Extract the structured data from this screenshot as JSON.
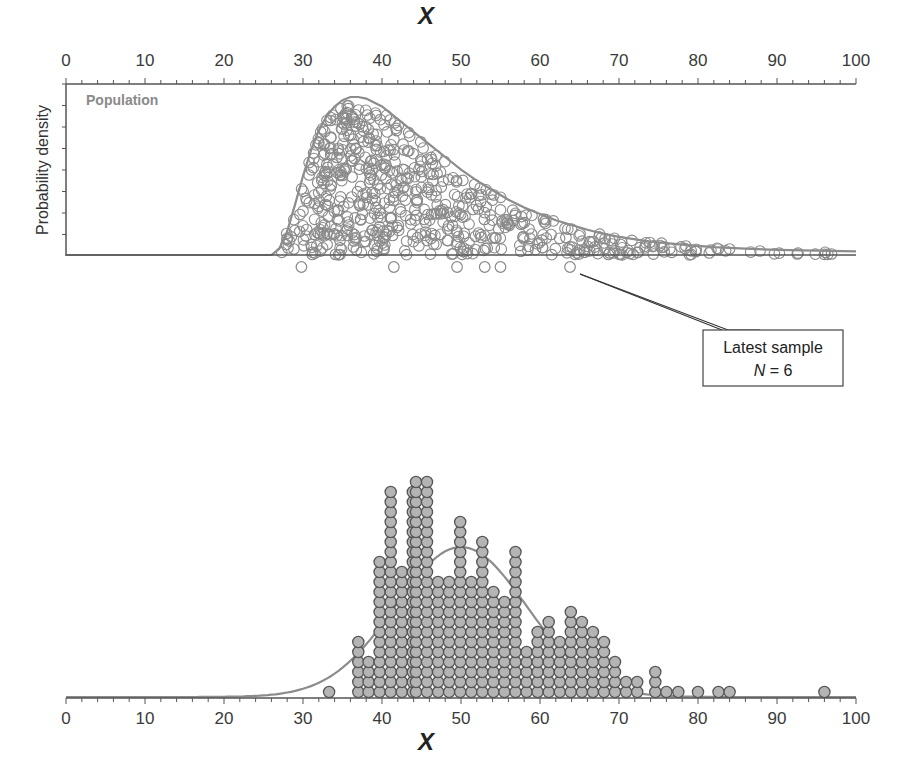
{
  "chart_data": [
    {
      "type": "scatter",
      "panel": "top",
      "title": "",
      "xlabel": "X",
      "ylabel": "Probability density",
      "xlim": [
        0,
        100
      ],
      "x_ticks": [
        0,
        10,
        20,
        30,
        40,
        50,
        60,
        70,
        80,
        90,
        100
      ],
      "x_axis_position": "top",
      "population_label": "Population",
      "population_curve": {
        "description": "right-skewed density, near zero below ~26, rising steeply to a peak near x=37, long tail to 100",
        "points": [
          [
            0,
            0.0
          ],
          [
            26,
            0.0
          ],
          [
            27,
            0.04
          ],
          [
            28,
            0.15
          ],
          [
            29,
            0.32
          ],
          [
            30,
            0.5
          ],
          [
            31,
            0.66
          ],
          [
            32,
            0.79
          ],
          [
            33,
            0.88
          ],
          [
            34,
            0.94
          ],
          [
            35,
            0.98
          ],
          [
            36,
            1.0
          ],
          [
            37,
            1.0
          ],
          [
            38,
            0.99
          ],
          [
            40,
            0.94
          ],
          [
            42,
            0.86
          ],
          [
            44,
            0.78
          ],
          [
            46,
            0.7
          ],
          [
            48,
            0.62
          ],
          [
            50,
            0.54
          ],
          [
            52,
            0.47
          ],
          [
            54,
            0.41
          ],
          [
            56,
            0.35
          ],
          [
            58,
            0.3
          ],
          [
            60,
            0.26
          ],
          [
            62,
            0.22
          ],
          [
            64,
            0.19
          ],
          [
            66,
            0.16
          ],
          [
            68,
            0.135
          ],
          [
            70,
            0.115
          ],
          [
            74,
            0.085
          ],
          [
            78,
            0.065
          ],
          [
            82,
            0.05
          ],
          [
            86,
            0.04
          ],
          [
            90,
            0.033
          ],
          [
            95,
            0.027
          ],
          [
            100,
            0.023
          ]
        ]
      },
      "population_points_description": "hundreds of open grey circles filling the area under the population curve",
      "latest_sample": {
        "label_line1": "Latest sample",
        "label_line2_italic": "N",
        "label_line2_rest": " = 6",
        "N": 6,
        "values": [
          29.8,
          41.5,
          49.5,
          53.0,
          55.0,
          63.8
        ]
      }
    },
    {
      "type": "dotplot",
      "panel": "bottom",
      "title": "",
      "xlabel": "X",
      "ylabel": "",
      "xlim": [
        0,
        100
      ],
      "x_ticks": [
        0,
        10,
        20,
        30,
        40,
        50,
        60,
        70,
        80,
        90,
        100
      ],
      "description": "stacked filled grey dots showing distribution of sample means, with a normal curve overlaid",
      "columns": [
        {
          "x": 33.3,
          "count": 1
        },
        {
          "x": 37.0,
          "count": 6
        },
        {
          "x": 38.3,
          "count": 4
        },
        {
          "x": 39.7,
          "count": 14
        },
        {
          "x": 41.1,
          "count": 21
        },
        {
          "x": 42.5,
          "count": 13
        },
        {
          "x": 43.9,
          "count": 21
        },
        {
          "x": 44.3,
          "count": 22
        },
        {
          "x": 45.7,
          "count": 22
        },
        {
          "x": 47.1,
          "count": 12
        },
        {
          "x": 48.5,
          "count": 12
        },
        {
          "x": 49.9,
          "count": 18
        },
        {
          "x": 51.3,
          "count": 12
        },
        {
          "x": 52.7,
          "count": 16
        },
        {
          "x": 54.1,
          "count": 11
        },
        {
          "x": 55.5,
          "count": 10
        },
        {
          "x": 56.9,
          "count": 15
        },
        {
          "x": 58.3,
          "count": 5
        },
        {
          "x": 59.7,
          "count": 7
        },
        {
          "x": 61.1,
          "count": 8
        },
        {
          "x": 62.5,
          "count": 6
        },
        {
          "x": 63.9,
          "count": 9
        },
        {
          "x": 65.3,
          "count": 8
        },
        {
          "x": 66.7,
          "count": 7
        },
        {
          "x": 68.1,
          "count": 6
        },
        {
          "x": 69.5,
          "count": 4
        },
        {
          "x": 70.9,
          "count": 2
        },
        {
          "x": 72.3,
          "count": 2
        },
        {
          "x": 74.6,
          "count": 3
        },
        {
          "x": 76.0,
          "count": 1
        },
        {
          "x": 77.5,
          "count": 1
        },
        {
          "x": 80.0,
          "count": 1
        },
        {
          "x": 82.6,
          "count": 1
        },
        {
          "x": 84.0,
          "count": 1
        },
        {
          "x": 96.0,
          "count": 1
        }
      ],
      "normal_curve": {
        "mean": 50,
        "sd": 8.3,
        "peak_count_equiv": 15
      }
    }
  ],
  "colors": {
    "axis": "#555555",
    "curve": "#8c8c8c",
    "open_circle": "#8a8a8a",
    "dot_fill": "#b4b4b4",
    "dot_stroke": "#555555",
    "callout_border": "#444444"
  }
}
